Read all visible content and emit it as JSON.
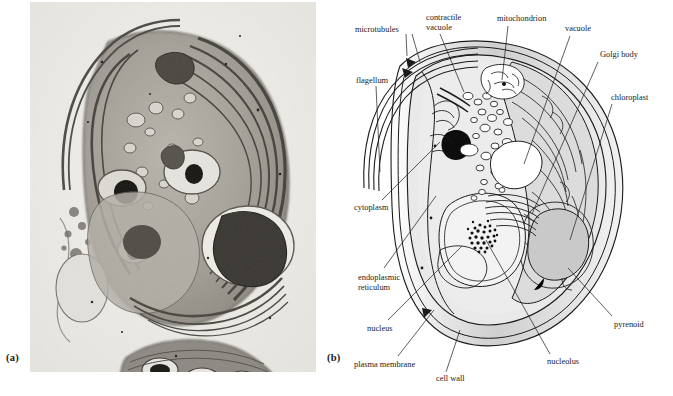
{
  "figure": {
    "panels": [
      {
        "id": "a",
        "label": "(a)",
        "kind": "electron-micrograph",
        "subject": "Chlamydomonas cell, transmission electron micrograph"
      },
      {
        "id": "b",
        "label": "(b)",
        "kind": "line-diagram",
        "subject": "Chlamydomonas cell, labelled interpretive drawing"
      }
    ]
  },
  "diagram": {
    "annotations": [
      {
        "key": "microtubules",
        "text": "microtubules",
        "x": 355,
        "y": 25,
        "align": "left"
      },
      {
        "key": "contractile-vacuole",
        "text": "contractile\nvacuole",
        "x": 426,
        "y": 13,
        "align": "left"
      },
      {
        "key": "mitochondrion",
        "text": "mitochondrion",
        "x": 497,
        "y": 14,
        "align": "left"
      },
      {
        "key": "vacuole",
        "text": "vacuole",
        "x": 565,
        "y": 24,
        "align": "left"
      },
      {
        "key": "golgi-body",
        "text": "Golgi body",
        "x": 600,
        "y": 50,
        "align": "left"
      },
      {
        "key": "flagellum",
        "text": "flagellum",
        "x": 356,
        "y": 76,
        "align": "left"
      },
      {
        "key": "chloroplast",
        "text": "chloroplast",
        "x": 611,
        "y": 93,
        "align": "left"
      },
      {
        "key": "cytoplasm",
        "text": "cytoplasm",
        "x": 354,
        "y": 203,
        "align": "left"
      },
      {
        "key": "endoplasmic-reticulum",
        "text": "endoplasmic\nreticulum",
        "x": 358,
        "y": 273,
        "align": "left"
      },
      {
        "key": "nucleus",
        "text": "nucleus",
        "x": 367,
        "y": 324,
        "align": "left"
      },
      {
        "key": "pyrenoid",
        "text": "pyrenoid",
        "x": 614,
        "y": 320,
        "align": "left"
      },
      {
        "key": "plasma-membrane",
        "text": "plasma membrane",
        "x": 354,
        "y": 360,
        "align": "left"
      },
      {
        "key": "cell-wall",
        "text": "cell wall",
        "x": 436,
        "y": 374,
        "align": "left"
      },
      {
        "key": "nucleolus",
        "text": "nucleolus",
        "x": 547,
        "y": 357,
        "align": "left"
      }
    ],
    "colors": {
      "ink": "#1b1b1b",
      "cytosol_fill": "#e9e9e9",
      "chloroplast_fill": "#dcdcdc",
      "pyrenoid_fill": "#c9c9c9",
      "wall_fill": "#e4e4e4",
      "eyespot_fill": "#0d0d0d",
      "background": "#ffffff"
    }
  },
  "micrograph": {
    "colors": {
      "background": "#efeeea",
      "cytoplasm_mid": "#a8a49c",
      "dark_organelle": "#2f2c28",
      "light_vacuole": "#e6e4de"
    }
  }
}
